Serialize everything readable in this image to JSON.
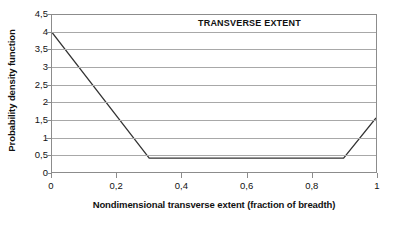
{
  "chart_data": {
    "type": "line",
    "title": "",
    "annotation": "TRANSVERSE EXTENT",
    "xlabel": "Nondimensional transverse extent (fraction of breadth)",
    "ylabel": "Probability density function",
    "xlim": [
      0,
      1
    ],
    "ylim": [
      0,
      4.5
    ],
    "grid": true,
    "legend": "none",
    "xticks": [
      "0",
      "0,2",
      "0,4",
      "0,6",
      "0,8",
      "1"
    ],
    "xtick_values": [
      0,
      0.2,
      0.4,
      0.6,
      0.8,
      1
    ],
    "yticks": [
      "0",
      "0,5",
      "1",
      "1,5",
      "2",
      "2,5",
      "3",
      "3,5",
      "4",
      "4,5"
    ],
    "ytick_values": [
      0,
      0.5,
      1,
      1.5,
      2,
      2.5,
      3,
      3.5,
      4,
      4.5
    ],
    "series": [
      {
        "name": "Probability density function",
        "color": "#333333",
        "x": [
          0,
          0.3,
          0.9,
          1
        ],
        "values": [
          4,
          0.4,
          0.4,
          1.55
        ]
      }
    ]
  }
}
